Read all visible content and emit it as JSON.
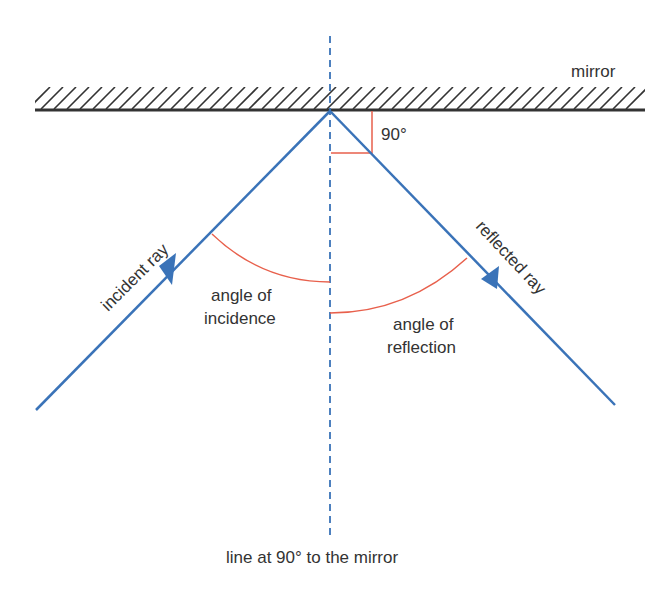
{
  "labels": {
    "mirror": "mirror",
    "right_angle": "90°",
    "incident_ray": "incident ray",
    "reflected_ray": "reflected ray",
    "angle_of_incidence_line1": "angle of",
    "angle_of_incidence_line2": "incidence",
    "angle_of_reflection_line1": "angle of",
    "angle_of_reflection_line2": "reflection",
    "normal": "line at 90° to the mirror"
  },
  "colors": {
    "ray": "#3a73b8",
    "normal_dashed": "#3a73b8",
    "angle_arc": "#e8604c",
    "mirror": "#333333",
    "text": "#333333"
  }
}
